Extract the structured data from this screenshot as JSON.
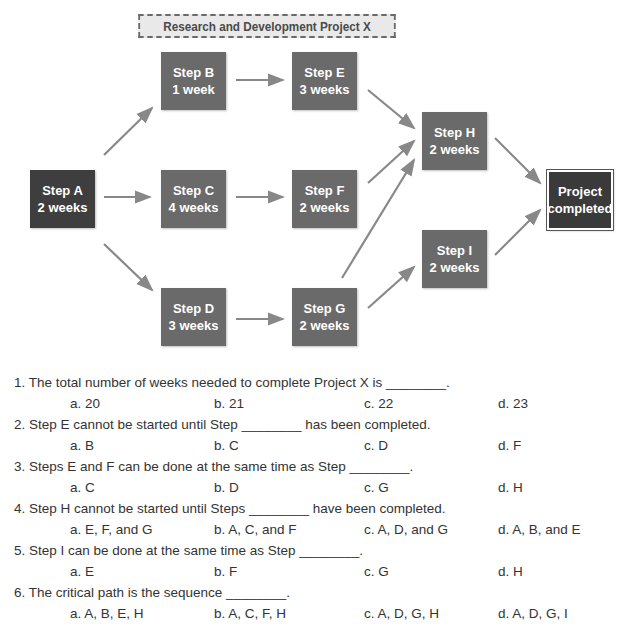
{
  "diagram": {
    "title": "Research and Development Project X",
    "nodes": [
      {
        "id": "A",
        "label": "Step A",
        "duration": "2 weeks"
      },
      {
        "id": "B",
        "label": "Step B",
        "duration": "1 week"
      },
      {
        "id": "C",
        "label": "Step C",
        "duration": "4 weeks"
      },
      {
        "id": "D",
        "label": "Step D",
        "duration": "3 weeks"
      },
      {
        "id": "E",
        "label": "Step E",
        "duration": "3 weeks"
      },
      {
        "id": "F",
        "label": "Step F",
        "duration": "2 weeks"
      },
      {
        "id": "G",
        "label": "Step G",
        "duration": "2 weeks"
      },
      {
        "id": "H",
        "label": "Step H",
        "duration": "2 weeks"
      },
      {
        "id": "I",
        "label": "Step I",
        "duration": "2 weeks"
      },
      {
        "id": "END",
        "label": "Project",
        "duration": "completed"
      }
    ],
    "edges": [
      [
        "A",
        "B"
      ],
      [
        "A",
        "C"
      ],
      [
        "A",
        "D"
      ],
      [
        "B",
        "E"
      ],
      [
        "C",
        "F"
      ],
      [
        "D",
        "G"
      ],
      [
        "E",
        "H"
      ],
      [
        "F",
        "H"
      ],
      [
        "G",
        "H"
      ],
      [
        "G",
        "I"
      ],
      [
        "H",
        "END"
      ],
      [
        "I",
        "END"
      ]
    ],
    "colors": {
      "node": "#6a6a6a",
      "start_node": "#3e3e3e",
      "end_node": "#3a3a3a",
      "arrow": "#888888"
    }
  },
  "questions": [
    {
      "text": "1.  The total number of weeks needed to complete Project X is ________.",
      "options": [
        "a. 20",
        "b. 21",
        "c. 22",
        "d. 23"
      ]
    },
    {
      "text": "2.  Step E cannot be started until Step ________ has been completed.",
      "options": [
        "a. B",
        "b. C",
        "c. D",
        "d. F"
      ]
    },
    {
      "text": "3.  Steps E and F can be done at the same time as Step ________.",
      "options": [
        "a. C",
        "b. D",
        "c. G",
        "d. H"
      ]
    },
    {
      "text": "4.  Step H cannot be started until Steps ________ have been completed.",
      "options": [
        "a. E, F, and G",
        "b. A, C, and F",
        "c. A, D, and G",
        "d. A, B, and E"
      ]
    },
    {
      "text": "5.  Step I can be done at the same time as Step ________.",
      "options": [
        "a. E",
        "b. F",
        "c. G",
        "d. H"
      ]
    },
    {
      "text": "6.  The critical path is the sequence ________.",
      "options": [
        "a. A, B, E, H",
        "b. A, C, F, H",
        "c. A, D, G, H",
        "d. A, D, G, I"
      ]
    }
  ]
}
